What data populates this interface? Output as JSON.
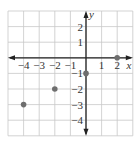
{
  "chart_data": {
    "type": "scatter",
    "title": "",
    "xlabel": "x",
    "ylabel": "y",
    "xlim": [
      -5,
      3
    ],
    "ylim": [
      -5,
      3
    ],
    "grid": true,
    "x_ticks": [
      "−4",
      "−3",
      "−2",
      "−1",
      "1",
      "2"
    ],
    "x_tick_values": [
      -4,
      -3,
      -2,
      -1,
      1,
      2
    ],
    "y_ticks": [
      "2",
      "1",
      "−1",
      "−2",
      "−3",
      "−4"
    ],
    "y_tick_values": [
      2,
      1,
      -1,
      -2,
      -3,
      -4
    ],
    "series": [
      {
        "name": "points",
        "points": [
          {
            "x": -4,
            "y": -3
          },
          {
            "x": -2,
            "y": -2
          },
          {
            "x": 0,
            "y": -1
          },
          {
            "x": 2,
            "y": 0
          }
        ]
      }
    ],
    "colors": {
      "grid": "#c8c8c8",
      "axis": "#222222",
      "point": "#6e6e6e",
      "text": "#333333"
    }
  }
}
